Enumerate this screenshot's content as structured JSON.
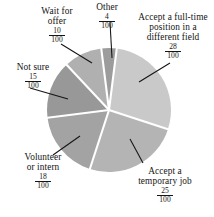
{
  "chart_data": {
    "type": "pie",
    "title": "",
    "subtitle": "",
    "xlabel": "",
    "ylabel": "",
    "legend_position": "none",
    "grid": false,
    "denominator": 100,
    "total": 100,
    "categories": [
      "Other",
      "Accept a full-time position in a different field",
      "Accept a temporary job",
      "Volunteer or intern",
      "Not sure",
      "Wait for offer"
    ],
    "values": [
      4,
      28,
      25,
      18,
      15,
      10
    ],
    "slices": [
      {
        "label": "Other",
        "label_line1": "Other",
        "label_line2": "",
        "label_line3": "",
        "numerator": "4",
        "denominator": "100",
        "value": 4,
        "color": "#9c9c9c",
        "start_angle": -7.2,
        "end_angle": 7.2
      },
      {
        "label": "Accept a full-time position in a different field",
        "label_line1": "Accept a full-time",
        "label_line2": "position in a",
        "label_line3": "different field",
        "numerator": "28",
        "denominator": "100",
        "value": 28,
        "color": "#c9c9c9",
        "start_angle": 7.2,
        "end_angle": 108.0
      },
      {
        "label": "Accept a temporary job",
        "label_line1": "Accept a",
        "label_line2": "temporary job",
        "label_line3": "",
        "numerator": "25",
        "denominator": "100",
        "value": 25,
        "color": "#b4b4b4",
        "start_angle": 108.0,
        "end_angle": 198.0
      },
      {
        "label": "Volunteer or intern",
        "label_line1": "Volunteer",
        "label_line2": "or intern",
        "label_line3": "",
        "numerator": "18",
        "denominator": "100",
        "value": 18,
        "color": "#a3a3a3",
        "start_angle": 198.0,
        "end_angle": 262.8
      },
      {
        "label": "Not sure",
        "label_line1": "Not sure",
        "label_line2": "",
        "label_line3": "",
        "numerator": "15",
        "denominator": "100",
        "value": 15,
        "color": "#989898",
        "start_angle": 262.8,
        "end_angle": 316.8
      },
      {
        "label": "Wait for offer",
        "label_line1": "Wait for",
        "label_line2": "offer",
        "label_line3": "",
        "numerator": "10",
        "denominator": "100",
        "value": 10,
        "color": "#b0b0b0",
        "start_angle": 316.8,
        "end_angle": 352.8
      }
    ]
  }
}
